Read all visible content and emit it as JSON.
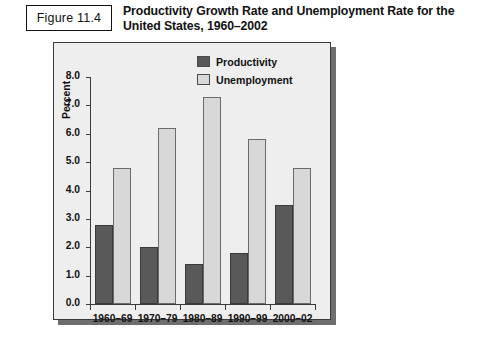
{
  "figure": {
    "number_label": "Figure 11.4",
    "title": "Productivity Growth Rate and Unemployment Rate for the United States, 1960–2002"
  },
  "colors": {
    "productivity": "#595959",
    "unemployment": "#d8d8d8",
    "panel_background": "#eeeeee",
    "axis": "#3a3a3a",
    "shadow": "#6e6e6e"
  },
  "chart_data": {
    "type": "bar",
    "title": "Productivity Growth Rate and Unemployment Rate for the United States, 1960–2002",
    "xlabel": "",
    "ylabel": "Percent",
    "ylim": [
      0.0,
      8.0
    ],
    "ytick_labels": [
      "0.0",
      "1.0",
      "2.0",
      "3.0",
      "4.0",
      "5.0",
      "6.0",
      "7.0",
      "8.0"
    ],
    "ytick_values": [
      0.0,
      1.0,
      2.0,
      3.0,
      4.0,
      5.0,
      6.0,
      7.0,
      8.0
    ],
    "grid": false,
    "legend_position": "top-right-inside",
    "categories": [
      "1960–69",
      "1970–79",
      "1980–89",
      "1990–99",
      "2000–02"
    ],
    "series": [
      {
        "name": "Productivity",
        "color": "#595959",
        "values": [
          2.8,
          2.0,
          1.4,
          1.8,
          3.5
        ]
      },
      {
        "name": "Unemployment",
        "color": "#d8d8d8",
        "values": [
          4.8,
          6.2,
          7.3,
          5.8,
          4.8
        ]
      }
    ]
  }
}
